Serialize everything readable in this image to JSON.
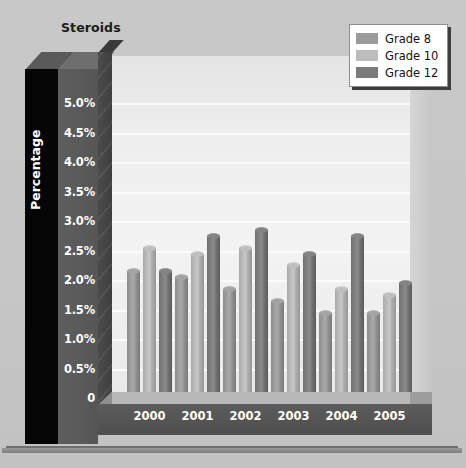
{
  "chart_data": {
    "type": "bar",
    "title": "Steroids",
    "xlabel": "",
    "ylabel": "Percentage",
    "categories": [
      "2000",
      "2001",
      "2002",
      "2003",
      "2004",
      "2005"
    ],
    "series": [
      {
        "name": "Grade 8",
        "color": "#9b9b9b",
        "values": [
          2.2,
          2.1,
          1.9,
          1.7,
          1.5,
          1.5
        ]
      },
      {
        "name": "Grade 10",
        "color": "#bcbcbc",
        "values": [
          2.6,
          2.5,
          2.6,
          2.3,
          1.9,
          1.8
        ]
      },
      {
        "name": "Grade 12",
        "color": "#7b7b7b",
        "values": [
          2.2,
          2.8,
          2.9,
          2.5,
          2.8,
          2.0
        ]
      }
    ],
    "ylim": [
      0,
      5.0
    ],
    "ytick_values": [
      5.0,
      4.5,
      4.0,
      3.5,
      3.0,
      2.5,
      2.0,
      1.5,
      1.0,
      0.5,
      0
    ],
    "ytick_labels": [
      "5.0%",
      "4.5%",
      "4.0%",
      "3.5%",
      "3.0%",
      "2.5%",
      "2.0%",
      "1.5%",
      "1.0%",
      "0.5%",
      "0"
    ],
    "grid": true,
    "legend_position": "top-right",
    "style": "3d-cylinder"
  },
  "legend": {
    "items": [
      {
        "label": "Grade 8"
      },
      {
        "label": "Grade 10"
      },
      {
        "label": "Grade 12"
      }
    ]
  }
}
